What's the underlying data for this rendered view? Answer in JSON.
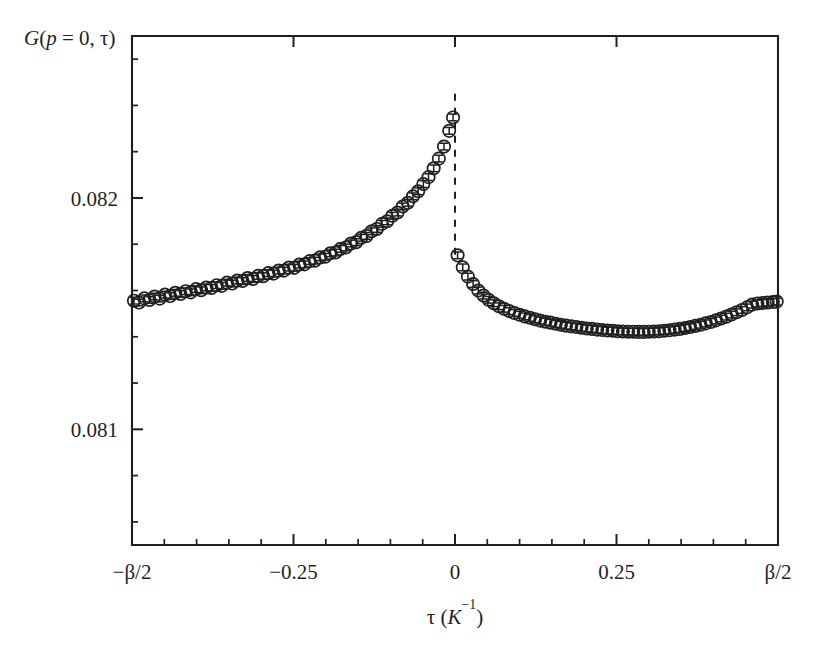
{
  "figure": {
    "background_color": "#ffffff",
    "ink_color": "#1f1f1f",
    "marker_style": "open-circle",
    "marker_radius": 6.2,
    "errorbar": true,
    "discontinuity_line": "dashed"
  },
  "labels": {
    "ylabel_part_G": "G",
    "ylabel_part_open": "(",
    "ylabel_part_p": "p",
    "ylabel_part_eq0": " = 0, ",
    "ylabel_part_tau": "τ",
    "ylabel_part_close": ")",
    "ylabel_full": "G(p = 0, τ)",
    "xlabel_tau": "τ",
    "xlabel_unit_open": " (",
    "xlabel_unit_K": "K",
    "xlabel_unit_exp": "−1",
    "xlabel_unit_close": ")",
    "xlabel_full": "τ (K⁻¹)"
  },
  "chart_data": {
    "type": "scatter",
    "title": "",
    "subtitle": "",
    "xlabel": "τ (K⁻¹)",
    "ylabel": "G(p = 0, τ)",
    "grid": false,
    "legend": null,
    "xlim": [
      -0.5,
      0.5
    ],
    "ylim": [
      0.0805,
      0.0827
    ],
    "xticks": [
      -0.5,
      -0.25,
      0,
      0.25,
      0.5
    ],
    "xticklabels": [
      "−β/2",
      "−0.25",
      "0",
      "0.25",
      "β/2"
    ],
    "xminor_count_between": 4,
    "yticks": [
      0.081,
      0.082
    ],
    "yticklabels": [
      "0.081",
      "0.082"
    ],
    "yminor_step": 0.0002,
    "annotations": [
      {
        "text": "discontinuity at τ = 0",
        "type": "dashed-vertical-line",
        "x": 0,
        "y0": 0.08245,
        "y1": 0.08175
      }
    ],
    "series": [
      {
        "name": "G(p=0,tau) branch tau<0",
        "marker": "open-circle",
        "x": [
          -0.497,
          -0.489,
          -0.481,
          -0.473,
          -0.465,
          -0.457,
          -0.449,
          -0.441,
          -0.433,
          -0.425,
          -0.417,
          -0.409,
          -0.401,
          -0.393,
          -0.385,
          -0.377,
          -0.369,
          -0.361,
          -0.353,
          -0.345,
          -0.337,
          -0.329,
          -0.321,
          -0.313,
          -0.305,
          -0.297,
          -0.289,
          -0.281,
          -0.273,
          -0.265,
          -0.257,
          -0.249,
          -0.241,
          -0.233,
          -0.225,
          -0.217,
          -0.209,
          -0.201,
          -0.193,
          -0.185,
          -0.177,
          -0.169,
          -0.161,
          -0.153,
          -0.145,
          -0.137,
          -0.129,
          -0.121,
          -0.113,
          -0.105,
          -0.097,
          -0.089,
          -0.081,
          -0.073,
          -0.065,
          -0.057,
          -0.049,
          -0.041,
          -0.033,
          -0.025,
          -0.017,
          -0.009,
          -0.003
        ],
        "y": [
          0.081556,
          0.081548,
          0.081566,
          0.081559,
          0.081574,
          0.081565,
          0.081582,
          0.081576,
          0.08159,
          0.081585,
          0.081597,
          0.081592,
          0.081606,
          0.081601,
          0.081613,
          0.081611,
          0.081623,
          0.08162,
          0.081634,
          0.08163,
          0.081643,
          0.081641,
          0.081654,
          0.08165,
          0.081663,
          0.081662,
          0.081675,
          0.081673,
          0.081686,
          0.081686,
          0.081699,
          0.081698,
          0.081712,
          0.081713,
          0.081727,
          0.081729,
          0.081743,
          0.081746,
          0.081761,
          0.081764,
          0.08178,
          0.081786,
          0.081803,
          0.081809,
          0.081828,
          0.081836,
          0.081856,
          0.081866,
          0.081888,
          0.081899,
          0.081923,
          0.081937,
          0.081963,
          0.081979,
          0.082007,
          0.082029,
          0.08206,
          0.08209,
          0.082128,
          0.08217,
          0.082222,
          0.08229,
          0.082348
        ],
        "yerr": [
          1.45e-05,
          1.45e-05,
          1.45e-05,
          1.45e-05,
          1.45e-05,
          1.45e-05,
          1.45e-05,
          1.45e-05,
          1.45e-05,
          1.45e-05,
          1.45e-05,
          1.45e-05,
          1.45e-05,
          1.45e-05,
          1.45e-05,
          1.45e-05,
          1.45e-05,
          1.45e-05,
          1.45e-05,
          1.45e-05,
          1.45e-05,
          1.45e-05,
          1.45e-05,
          1.45e-05,
          1.45e-05,
          1.45e-05,
          1.45e-05,
          1.45e-05,
          1.45e-05,
          1.45e-05,
          1.45e-05,
          1.45e-05,
          1.45e-05,
          1.45e-05,
          1.45e-05,
          1.45e-05,
          1.45e-05,
          1.45e-05,
          1.45e-05,
          1.45e-05,
          1.45e-05,
          1.45e-05,
          1.45e-05,
          1.45e-05,
          1.45e-05,
          1.45e-05,
          1.45e-05,
          1.45e-05,
          1.45e-05,
          1.45e-05,
          1.45e-05,
          1.45e-05,
          1.45e-05,
          1.45e-05,
          1.45e-05,
          1.45e-05,
          1.45e-05,
          1.45e-05,
          1.45e-05,
          1.45e-05,
          1.45e-05,
          1.45e-05,
          1.45e-05
        ]
      },
      {
        "name": "G(p=0,tau) branch tau>0",
        "marker": "open-circle",
        "x": [
          0.004,
          0.012,
          0.02,
          0.028,
          0.036,
          0.044,
          0.052,
          0.06,
          0.068,
          0.076,
          0.084,
          0.092,
          0.1,
          0.108,
          0.116,
          0.124,
          0.132,
          0.14,
          0.148,
          0.156,
          0.164,
          0.172,
          0.18,
          0.188,
          0.196,
          0.204,
          0.212,
          0.22,
          0.228,
          0.236,
          0.244,
          0.252,
          0.26,
          0.268,
          0.276,
          0.284,
          0.292,
          0.3,
          0.308,
          0.316,
          0.324,
          0.332,
          0.34,
          0.348,
          0.356,
          0.364,
          0.372,
          0.38,
          0.388,
          0.396,
          0.404,
          0.412,
          0.42,
          0.428,
          0.436,
          0.444,
          0.452,
          0.46,
          0.468,
          0.476,
          0.484,
          0.492,
          0.498
        ],
        "y": [
          0.081752,
          0.0817,
          0.08166,
          0.081628,
          0.0816,
          0.081578,
          0.08156,
          0.081545,
          0.081532,
          0.081521,
          0.081511,
          0.081503,
          0.081495,
          0.081488,
          0.081482,
          0.081476,
          0.08147,
          0.081465,
          0.081461,
          0.081456,
          0.081452,
          0.081448,
          0.081445,
          0.081442,
          0.081439,
          0.081436,
          0.081434,
          0.081431,
          0.081429,
          0.081427,
          0.081426,
          0.081424,
          0.081423,
          0.081422,
          0.081422,
          0.081421,
          0.081421,
          0.081422,
          0.081423,
          0.081424,
          0.081426,
          0.081428,
          0.081431,
          0.081434,
          0.081438,
          0.081442,
          0.081447,
          0.081452,
          0.081458,
          0.081464,
          0.081471,
          0.081479,
          0.081487,
          0.081496,
          0.081506,
          0.081516,
          0.081527,
          0.081539,
          0.081544,
          0.081546,
          0.081548,
          0.08155,
          0.081552
        ],
        "yerr": [
          1.45e-05,
          1.45e-05,
          1.45e-05,
          1.45e-05,
          1.45e-05,
          1.45e-05,
          1.45e-05,
          1.45e-05,
          1.45e-05,
          1.45e-05,
          1.45e-05,
          1.45e-05,
          1.45e-05,
          1.45e-05,
          1.45e-05,
          1.45e-05,
          1.45e-05,
          1.45e-05,
          1.45e-05,
          1.45e-05,
          1.45e-05,
          1.45e-05,
          1.45e-05,
          1.45e-05,
          1.45e-05,
          1.45e-05,
          1.45e-05,
          1.45e-05,
          1.45e-05,
          1.45e-05,
          1.45e-05,
          1.45e-05,
          1.45e-05,
          1.45e-05,
          1.45e-05,
          1.45e-05,
          1.45e-05,
          1.45e-05,
          1.45e-05,
          1.45e-05,
          1.45e-05,
          1.45e-05,
          1.45e-05,
          1.45e-05,
          1.45e-05,
          1.45e-05,
          1.45e-05,
          1.45e-05,
          1.45e-05,
          1.45e-05,
          1.45e-05,
          1.45e-05,
          1.45e-05,
          1.45e-05,
          1.45e-05,
          1.45e-05,
          1.45e-05,
          1.45e-05,
          1.45e-05,
          1.45e-05,
          1.45e-05,
          1.45e-05,
          1.45e-05
        ]
      }
    ]
  }
}
